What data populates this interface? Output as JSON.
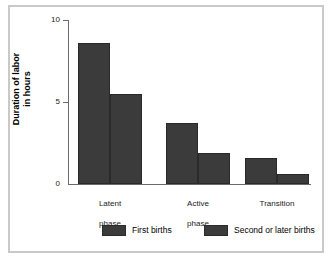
{
  "chart_data": {
    "type": "bar",
    "title": "",
    "subtitle": "",
    "xlabel": "",
    "ylabel": "Duration of labor\nin hours",
    "ylabel_line1": "Duration of labor",
    "ylabel_line2": "in hours",
    "categories": [
      "Latent phase",
      "Active phase",
      "Transition"
    ],
    "category_lines": [
      {
        "line1": "Latent",
        "line2": "phase"
      },
      {
        "line1": "Active",
        "line2": "phase"
      },
      {
        "line1": "Transition",
        "line2": ""
      }
    ],
    "series": [
      {
        "name": "First births",
        "values": [
          8.6,
          3.7,
          1.6
        ],
        "color": "#3b3b3b"
      },
      {
        "name": "Second or later births",
        "values": [
          5.5,
          1.9,
          0.6
        ],
        "color": "#3b3b3b"
      }
    ],
    "ylim": [
      0,
      10
    ],
    "yticks": [
      0,
      5,
      10
    ],
    "ytick_labels": [
      "0",
      "5",
      "10"
    ],
    "grid": false,
    "legend_position": "bottom"
  },
  "axis": {
    "ytick_10": "10",
    "ytick_5": "5",
    "ytick_0": "0"
  },
  "legend": {
    "items": [
      {
        "label": "First births"
      },
      {
        "label": "Second or later births"
      }
    ]
  }
}
